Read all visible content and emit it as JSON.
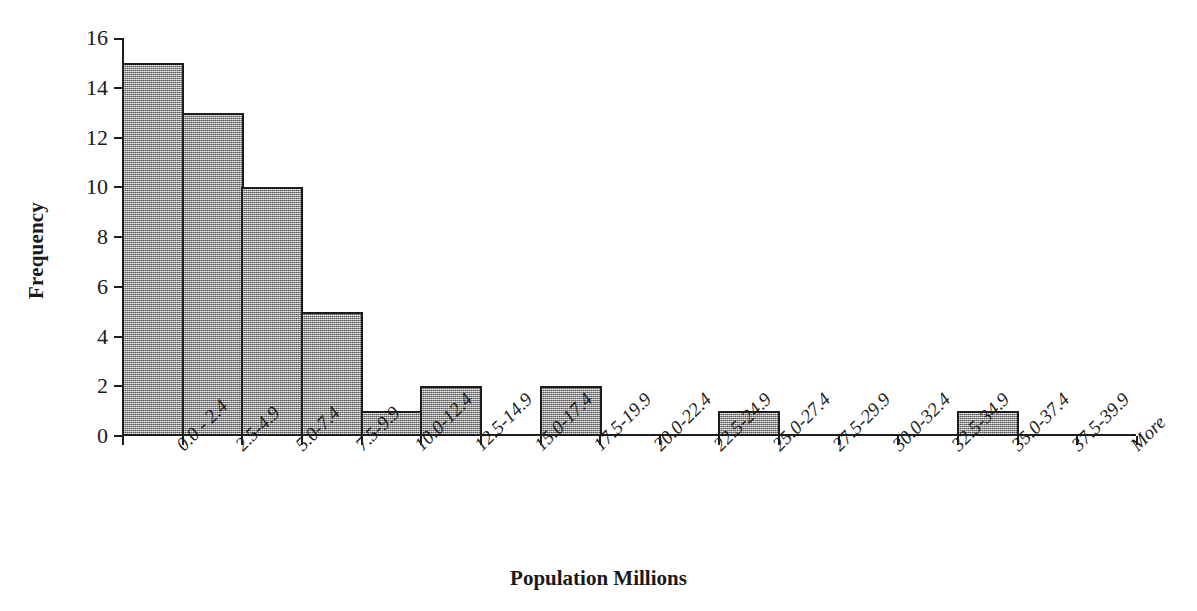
{
  "chart_data": {
    "type": "bar",
    "title": "",
    "subtitle": "",
    "xlabel": "Population Millions",
    "ylabel": "Frequency",
    "categories": [
      "0.0 - 2.4",
      "2.5-4.9",
      "5.0-7.4",
      "7.5-9.9",
      "10.0-12.4",
      "12.5-14.9",
      "15.0-17.4",
      "17.5-19.9",
      "20.0-22.4",
      "22.5-24.9",
      "25.0-27.4",
      "27.5-29.9",
      "30.0-32.4",
      "32.5-34.9",
      "35.0-37.4",
      "37.5-39.9",
      "More"
    ],
    "values": [
      15,
      13,
      10,
      5,
      1,
      2,
      0,
      2,
      0,
      0,
      1,
      0,
      0,
      0,
      1,
      0,
      0
    ],
    "ylim": [
      0,
      16
    ],
    "ytick_labels": [
      "16",
      "14",
      "12",
      "10",
      "8",
      "6",
      "4",
      "2",
      "0"
    ],
    "ytick_values": [
      16,
      14,
      12,
      10,
      8,
      6,
      4,
      2,
      0
    ],
    "grid": false,
    "legend": false,
    "legend_position": "none",
    "bar_fill_color": "#9a9a9a",
    "bar_border_color": "#1d1d1d",
    "axis_color": "#1d1d1d",
    "background_color": "#ffffff"
  }
}
